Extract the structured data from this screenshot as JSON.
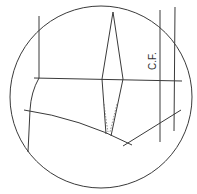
{
  "diagram": {
    "type": "pattern-drafting-detail",
    "labels": {
      "center_front": "C.F."
    },
    "colors": {
      "line": "#3a3a3a",
      "background": "#ffffff"
    }
  }
}
